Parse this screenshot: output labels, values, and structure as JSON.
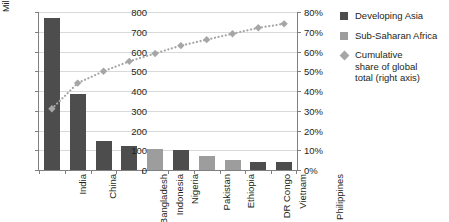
{
  "chart_data": {
    "type": "bar",
    "title": "",
    "xlabel": "",
    "ylabel": "Million",
    "ylabel_right": "",
    "ylim": [
      0,
      800
    ],
    "ylim_right": [
      0,
      0.8
    ],
    "grid": true,
    "legend_position": "right",
    "categories": [
      "India",
      "China",
      "Bangladesh",
      "Indonesia",
      "Nigeria",
      "Pakistan",
      "Ethiopia",
      "DR Congo",
      "Vietnam",
      "Philippines"
    ],
    "values": [
      770,
      385,
      148,
      123,
      108,
      101,
      72,
      52,
      42,
      40
    ],
    "groups": [
      "Developing Asia",
      "Developing Asia",
      "Developing Asia",
      "Developing Asia",
      "Sub-Saharan Africa",
      "Developing Asia",
      "Sub-Saharan Africa",
      "Sub-Saharan Africa",
      "Developing Asia",
      "Developing Asia"
    ],
    "series": [
      {
        "name": "Cumulative share of global total (right axis)",
        "axis": "right",
        "values": [
          0.31,
          0.44,
          0.5,
          0.55,
          0.59,
          0.63,
          0.66,
          0.69,
          0.72,
          0.74
        ]
      }
    ],
    "ytick_labels": [
      "0",
      "100",
      "200",
      "300",
      "400",
      "500",
      "600",
      "700",
      "800"
    ],
    "ytick_values": [
      0,
      100,
      200,
      300,
      400,
      500,
      600,
      700,
      800
    ],
    "ytick_labels_right": [
      "0%",
      "10%",
      "20%",
      "30%",
      "40%",
      "50%",
      "60%",
      "70%",
      "80%"
    ],
    "ytick_values_right": [
      0,
      0.1,
      0.2,
      0.3,
      0.4,
      0.5,
      0.6,
      0.7,
      0.8
    ]
  },
  "legend": {
    "items": [
      {
        "label": "Developing Asia",
        "marker": "square",
        "color": "#4d4d4d"
      },
      {
        "label": "Sub-Saharan Africa",
        "marker": "square",
        "color": "#9d9d9d"
      },
      {
        "label": "Cumulative\nshare of global\ntotal (right axis)",
        "marker": "diamond",
        "color": "#a6a6a6"
      }
    ]
  },
  "colors": {
    "developing_asia": "#4d4d4d",
    "sub_saharan_africa": "#9d9d9d",
    "cumulative_line": "#a6a6a6",
    "gridline": "#d9d9d9",
    "axis": "#808080",
    "text": "#231f20"
  }
}
